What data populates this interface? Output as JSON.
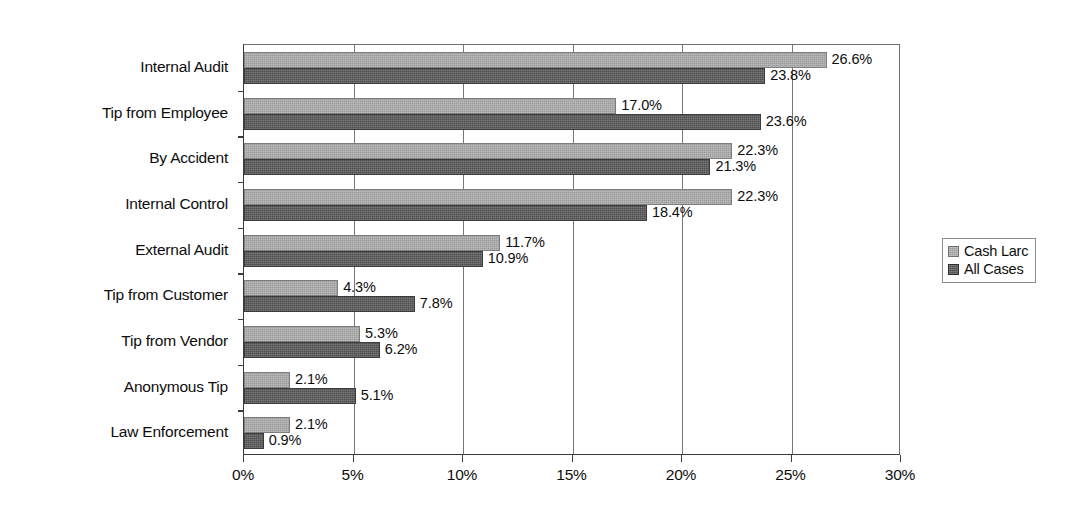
{
  "chart_data": {
    "type": "bar",
    "orientation": "horizontal",
    "title": "",
    "xlabel": "",
    "ylabel": "",
    "xlim": [
      0,
      30
    ],
    "xticks": [
      "0%",
      "5%",
      "10%",
      "15%",
      "20%",
      "25%",
      "30%"
    ],
    "xtick_values": [
      0,
      5,
      10,
      15,
      20,
      25,
      30
    ],
    "grid": true,
    "grid_axis": "x",
    "legend_position": "right",
    "categories": [
      "Internal Audit",
      "Tip from Employee",
      "By Accident",
      "Internal Control",
      "External Audit",
      "Tip from Customer",
      "Tip from Vendor",
      "Anonymous Tip",
      "Law Enforcement"
    ],
    "series": [
      {
        "name": "Cash Larc",
        "color": "#9a9a9a",
        "values": [
          26.6,
          17.0,
          22.3,
          22.3,
          11.7,
          4.3,
          5.3,
          2.1,
          2.1
        ],
        "labels": [
          "26.6%",
          "17.0%",
          "22.3%",
          "22.3%",
          "11.7%",
          "4.3%",
          "5.3%",
          "2.1%",
          "2.1%"
        ]
      },
      {
        "name": "All Cases",
        "color": "#4f4f4f",
        "values": [
          23.8,
          23.6,
          21.3,
          18.4,
          10.9,
          7.8,
          6.2,
          5.1,
          0.9
        ],
        "labels": [
          "23.8%",
          "23.6%",
          "21.3%",
          "18.4%",
          "10.9%",
          "7.8%",
          "6.2%",
          "5.1%",
          "0.9%"
        ]
      }
    ]
  },
  "legend": {
    "items": [
      {
        "label": "Cash Larc"
      },
      {
        "label": "All Cases"
      }
    ]
  }
}
